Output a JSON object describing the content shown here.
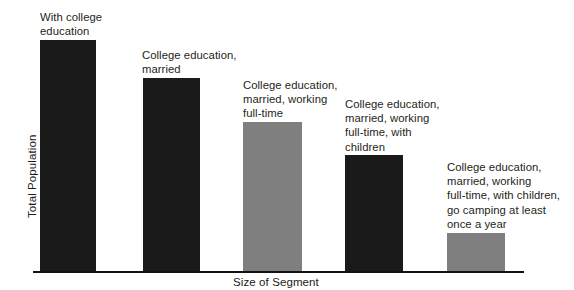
{
  "chart_data": {
    "type": "bar",
    "title": "",
    "subtitle": "",
    "xlabel": "Size of Segment",
    "ylabel": "Total Population",
    "grid": false,
    "legend": "none",
    "axis_ranges": {
      "y_min": 0,
      "y_max": 100,
      "y_ticks_shown": false,
      "x_ticks_shown": false
    },
    "categories": [
      "With college education",
      "College education, married",
      "College education, married, working full-time",
      "College education, married, working full-time, with children",
      "College education, married, working full-time, with children, go camping at least once a year"
    ],
    "values": [
      100,
      83,
      64,
      50,
      16
    ],
    "value_units": "relative share of total population (approx., read from bar heights)",
    "bar_colors": [
      "#1a1a1a",
      "#1a1a1a",
      "#7f7f7f",
      "#1a1a1a",
      "#7f7f7f"
    ],
    "annotations": [
      "With college\neducation",
      "College education,\nmarried",
      "College education,\nmarried, working\nfull-time",
      "College education,\nmarried, working\nfull-time, with\nchildren",
      "College education,\nmarried, working\nfull-time, with children,\ngo camping at least\nonce a year"
    ]
  },
  "axes": {
    "x_title": "Size of Segment",
    "y_title": "Total Population"
  },
  "bars": [
    {
      "id": "bar-1",
      "label": "With college\neducation",
      "color": "#1a1a1a",
      "x": 40,
      "width": 56,
      "top": 40,
      "height": 231,
      "label_x": 40,
      "label_y": 10
    },
    {
      "id": "bar-2",
      "label": "College education,\nmarried",
      "color": "#1a1a1a",
      "x": 143,
      "width": 57,
      "top": 78,
      "height": 193,
      "label_x": 142,
      "label_y": 48
    },
    {
      "id": "bar-3",
      "label": "College education,\nmarried, working\nfull-time",
      "color": "#7f7f7f",
      "x": 243,
      "width": 59,
      "top": 122,
      "height": 149,
      "label_x": 243,
      "label_y": 78
    },
    {
      "id": "bar-4",
      "label": "College education,\nmarried, working\nfull-time, with\nchildren",
      "color": "#1a1a1a",
      "x": 345,
      "width": 58,
      "top": 155,
      "height": 116,
      "label_x": 345,
      "label_y": 97
    },
    {
      "id": "bar-5",
      "label": "College education,\nmarried, working\nfull-time, with children,\ngo camping at least\nonce a year",
      "color": "#7f7f7f",
      "x": 447,
      "width": 58,
      "top": 233,
      "height": 38,
      "label_x": 447,
      "label_y": 160
    }
  ],
  "axis_line": {
    "x": 33,
    "y": 271,
    "width": 491,
    "thickness": 2
  },
  "colors": {
    "background": "#ffffff",
    "dark_bar": "#1a1a1a",
    "gray_bar": "#7f7f7f",
    "text": "#231f20",
    "axis": "#121212"
  }
}
